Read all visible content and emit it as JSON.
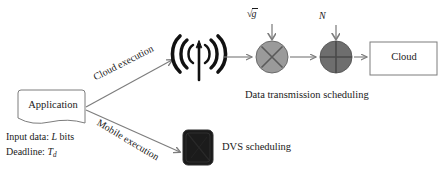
{
  "figure": {
    "colors": {
      "stroke": "#7d7d7d",
      "text": "#1a1a1a",
      "multiplier_fill": "#9a9a9a",
      "adder_fill": "#6e6e6e",
      "antenna": "#111111",
      "chip": "#1b1b1b"
    }
  },
  "nodes": {
    "application": {
      "label": "Application"
    },
    "cloud": {
      "label": "Cloud"
    },
    "antenna": {
      "icon": "broadcast-antenna-icon"
    },
    "dvs_chip": {
      "icon": "processor-chip-icon"
    },
    "multiplier": {
      "icon": "circle-times-icon",
      "input_label": "g",
      "input_label_full": "√g"
    },
    "adder": {
      "icon": "circle-plus-icon",
      "input_label": "N"
    }
  },
  "edges": {
    "cloud_execution": {
      "label": "Cloud execution"
    },
    "mobile_execution": {
      "label": "Mobile execution"
    }
  },
  "annotations": {
    "input_data_prefix": "Input data: ",
    "input_data_var": "L",
    "input_data_suffix": " bits",
    "deadline_prefix": "Deadline: ",
    "deadline_var": "T",
    "deadline_sub": "d",
    "data_transmission_caption": "Data transmission scheduling",
    "dvs_caption": "DVS scheduling",
    "channel_gain_symbol": "g",
    "noise_symbol": "N"
  }
}
